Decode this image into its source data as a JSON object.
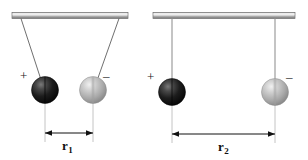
{
  "figure": {
    "background_color": "#ffffff",
    "width": 308,
    "height": 160,
    "panels": [
      {
        "id": "left-panel",
        "name": "close-separation-pendulum-pair",
        "support_bar": {
          "name": "ceiling-support-bar",
          "x1": 12,
          "x2": 128,
          "y": 15,
          "fill_light": "#d8d8d8",
          "fill_dark": "#8c8c8c",
          "stroke": "#6e6e6e"
        },
        "strings": [
          {
            "name": "left-string",
            "x1": 21,
            "y1": 18,
            "x2": 45,
            "y2": 90,
            "color": "#5a5a5a"
          },
          {
            "name": "right-string",
            "x1": 119,
            "y1": 18,
            "x2": 93,
            "y2": 90,
            "color": "#5a5a5a"
          }
        ],
        "spheres": [
          {
            "name": "positive-charged-sphere",
            "charge": "+",
            "cx": 45,
            "cy": 90,
            "r": 13.5,
            "shade": "dark",
            "highlight_color": "#6f6f6f",
            "mid_color": "#2a2a2a",
            "edge_color": "#050505"
          },
          {
            "name": "negative-charged-sphere",
            "charge": "−",
            "cx": 93,
            "cy": 90,
            "r": 13.5,
            "shade": "light",
            "highlight_color": "#eaeaea",
            "mid_color": "#b3b3b3",
            "edge_color": "#8a8a8a"
          }
        ],
        "charge_signs": [
          {
            "name": "plus-sign-left-sphere",
            "text": "+",
            "x": 21,
            "y": 71
          },
          {
            "name": "minus-sign-right-sphere",
            "text": "–",
            "x": 103,
            "y": 71
          }
        ],
        "extension_lines": [
          {
            "name": "extension-line-left",
            "x": 45,
            "y1": 102,
            "y2": 142,
            "color": "#b0b0b0"
          },
          {
            "name": "extension-line-right",
            "x": 93,
            "y1": 102,
            "y2": 142,
            "color": "#b0b0b0"
          }
        ],
        "dimension": {
          "name": "separation-dimension-r1",
          "label": "r",
          "subscript": "1",
          "x1": 45,
          "x2": 93,
          "y": 133,
          "label_x": 62,
          "label_y": 139,
          "color": "#111111"
        }
      },
      {
        "id": "right-panel",
        "name": "wide-separation-pendulum-pair",
        "support_bar": {
          "name": "ceiling-support-bar",
          "x1": 153,
          "x2": 295,
          "y": 15,
          "fill_light": "#d8d8d8",
          "fill_dark": "#8c8c8c",
          "stroke": "#6e6e6e"
        },
        "strings": [
          {
            "name": "left-string",
            "x1": 172,
            "y1": 18,
            "x2": 172,
            "y2": 92,
            "color": "#8f8f8f"
          },
          {
            "name": "right-string",
            "x1": 275,
            "y1": 18,
            "x2": 275,
            "y2": 92,
            "color": "#8f8f8f"
          }
        ],
        "spheres": [
          {
            "name": "positive-charged-sphere",
            "charge": "+",
            "cx": 172,
            "cy": 92,
            "r": 13.5,
            "shade": "dark",
            "highlight_color": "#6f6f6f",
            "mid_color": "#2a2a2a",
            "edge_color": "#050505"
          },
          {
            "name": "negative-charged-sphere",
            "charge": "−",
            "cx": 275,
            "cy": 92,
            "r": 13.5,
            "shade": "light",
            "highlight_color": "#eaeaea",
            "mid_color": "#b3b3b3",
            "edge_color": "#8a8a8a"
          }
        ],
        "charge_signs": [
          {
            "name": "plus-sign-left-sphere",
            "text": "+",
            "x": 148,
            "y": 72
          },
          {
            "name": "minus-sign-right-sphere",
            "text": "–",
            "x": 286,
            "y": 72
          }
        ],
        "extension_lines": [
          {
            "name": "extension-line-left",
            "x": 172,
            "y1": 104,
            "y2": 143,
            "color": "#b0b0b0"
          },
          {
            "name": "extension-line-right",
            "x": 275,
            "y1": 104,
            "y2": 143,
            "color": "#b0b0b0"
          }
        ],
        "dimension": {
          "name": "separation-dimension-r2",
          "label": "r",
          "subscript": "2",
          "x1": 172,
          "x2": 275,
          "y": 134,
          "label_x": 219,
          "label_y": 140,
          "color": "#111111"
        }
      }
    ]
  }
}
